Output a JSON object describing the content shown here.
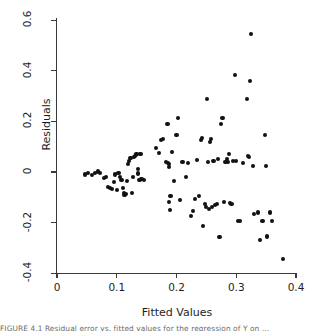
{
  "figure": {
    "caption_partial": "FIGURE 4.1   Residual error vs. fitted values for the regression of Y on ..."
  },
  "chart_data": {
    "type": "scatter",
    "title": "",
    "xlabel": "Fitted Values",
    "ylabel": "Residuals",
    "xlim": [
      0,
      0.4
    ],
    "ylim": [
      -0.4,
      0.6
    ],
    "xticks": [
      0,
      0.1,
      0.2,
      0.3,
      0.4
    ],
    "xticklabels": [
      "0",
      "0.1",
      "0.2",
      "0.3",
      "0.4"
    ],
    "yticks": [
      -0.4,
      -0.2,
      0,
      0.2,
      0.4,
      0.6
    ],
    "yticklabels": [
      "-0.4",
      "-0.2",
      "0",
      "0.2",
      "0.4",
      "0.6"
    ],
    "grid": false,
    "legend": null,
    "marker": "filled-circle",
    "marker_color": "#111111",
    "n_points": 108,
    "points": [
      [
        0.047,
        -0.01
      ],
      [
        0.052,
        -0.005
      ],
      [
        0.058,
        -0.012
      ],
      [
        0.063,
        -0.003
      ],
      [
        0.068,
        0.002
      ],
      [
        0.072,
        -0.004
      ],
      [
        0.078,
        -0.022
      ],
      [
        0.082,
        -0.018
      ],
      [
        0.085,
        -0.06
      ],
      [
        0.088,
        -0.065
      ],
      [
        0.092,
        -0.068
      ],
      [
        0.095,
        -0.04
      ],
      [
        0.097,
        -0.01
      ],
      [
        0.1,
        -0.072
      ],
      [
        0.103,
        -0.004
      ],
      [
        0.105,
        -0.02
      ],
      [
        0.108,
        -0.03
      ],
      [
        0.11,
        -0.064
      ],
      [
        0.112,
        -0.082
      ],
      [
        0.113,
        -0.09
      ],
      [
        0.115,
        -0.088
      ],
      [
        0.117,
        -0.035
      ],
      [
        0.119,
        0.03
      ],
      [
        0.121,
        0.042
      ],
      [
        0.123,
        0.055
      ],
      [
        0.125,
        -0.082
      ],
      [
        0.127,
        -0.018
      ],
      [
        0.129,
        0.06
      ],
      [
        0.131,
        0.062
      ],
      [
        0.132,
        0.068
      ],
      [
        0.133,
        0.07
      ],
      [
        0.135,
        0.012
      ],
      [
        0.136,
        -0.006
      ],
      [
        0.138,
        -0.03
      ],
      [
        0.139,
        0.07
      ],
      [
        0.14,
        0.072
      ],
      [
        0.141,
        -0.028
      ],
      [
        0.143,
        -0.026
      ],
      [
        0.145,
        -0.03
      ],
      [
        0.166,
        0.095
      ],
      [
        0.17,
        0.075
      ],
      [
        0.174,
        0.128
      ],
      [
        0.178,
        0.13
      ],
      [
        0.182,
        0.038
      ],
      [
        0.185,
        0.19
      ],
      [
        0.186,
        0.035
      ],
      [
        0.187,
        0.02
      ],
      [
        0.188,
        0.03
      ],
      [
        0.188,
        -0.12
      ],
      [
        0.189,
        -0.15
      ],
      [
        0.19,
        -0.095
      ],
      [
        0.193,
        0.08
      ],
      [
        0.196,
        -0.035
      ],
      [
        0.2,
        0.148
      ],
      [
        0.203,
        0.215
      ],
      [
        0.206,
        -0.11
      ],
      [
        0.21,
        0.04
      ],
      [
        0.216,
        -0.02
      ],
      [
        0.22,
        0.035
      ],
      [
        0.224,
        -0.175
      ],
      [
        0.228,
        -0.155
      ],
      [
        0.231,
        -0.105
      ],
      [
        0.235,
        0.048
      ],
      [
        0.238,
        -0.095
      ],
      [
        0.241,
        0.128
      ],
      [
        0.243,
        0.135
      ],
      [
        0.245,
        -0.215
      ],
      [
        0.247,
        -0.125
      ],
      [
        0.249,
        -0.14
      ],
      [
        0.251,
        0.29
      ],
      [
        0.252,
        0.038
      ],
      [
        0.254,
        -0.148
      ],
      [
        0.256,
        0.118
      ],
      [
        0.258,
        0.13
      ],
      [
        0.259,
        -0.138
      ],
      [
        0.262,
        0.043
      ],
      [
        0.265,
        -0.13
      ],
      [
        0.268,
        -0.125
      ],
      [
        0.27,
        0.052
      ],
      [
        0.272,
        -0.258
      ],
      [
        0.275,
        0.19
      ],
      [
        0.277,
        0.212
      ],
      [
        0.28,
        -0.118
      ],
      [
        0.282,
        0.04
      ],
      [
        0.284,
        0.05
      ],
      [
        0.286,
        0.038
      ],
      [
        0.288,
        0.07
      ],
      [
        0.29,
        -0.122
      ],
      [
        0.292,
        -0.125
      ],
      [
        0.295,
        0.042
      ],
      [
        0.298,
        0.385
      ],
      [
        0.3,
        0.045
      ],
      [
        0.303,
        -0.195
      ],
      [
        0.306,
        -0.192
      ],
      [
        0.312,
        0.036
      ],
      [
        0.318,
        0.29
      ],
      [
        0.32,
        0.062
      ],
      [
        0.322,
        0.058
      ],
      [
        0.323,
        0.36
      ],
      [
        0.325,
        0.545
      ],
      [
        0.328,
        0.022
      ],
      [
        0.33,
        -0.165
      ],
      [
        0.336,
        -0.16
      ],
      [
        0.34,
        -0.27
      ],
      [
        0.344,
        -0.192
      ],
      [
        0.348,
        0.145
      ],
      [
        0.35,
        0.025
      ],
      [
        0.352,
        -0.255
      ],
      [
        0.356,
        -0.16
      ],
      [
        0.36,
        -0.192
      ],
      [
        0.378,
        -0.345
      ]
    ]
  }
}
